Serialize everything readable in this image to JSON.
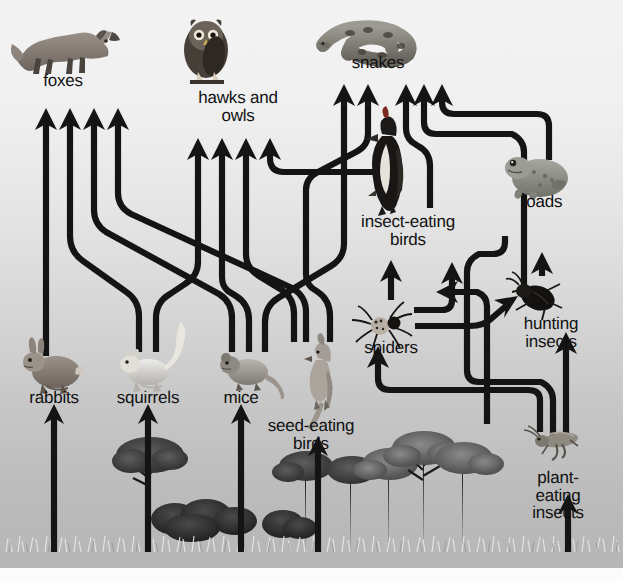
{
  "diagram": {
    "type": "food-web",
    "background": {
      "gradient_top": "#f3f3f3",
      "gradient_bottom": "#b6b6b6",
      "arrow_color": "#141414",
      "label_color": "#111111"
    },
    "nodes": [
      {
        "id": "foxes",
        "label": "foxes",
        "label_x": 63,
        "label_y": 80,
        "icon": "fox-icon",
        "trophic": "top-predator"
      },
      {
        "id": "hawks-and-owls",
        "label": "hawks and\nowls",
        "label_x": 238,
        "label_y": 97,
        "icon": "owl-icon",
        "trophic": "top-predator"
      },
      {
        "id": "snakes",
        "label": "snakes",
        "label_x": 378,
        "label_y": 61,
        "icon": "snake-icon",
        "trophic": "predator"
      },
      {
        "id": "toads",
        "label": "toads",
        "label_x": 542,
        "label_y": 200,
        "icon": "toad-icon",
        "trophic": "predator"
      },
      {
        "id": "insect-eating-birds",
        "label": "insect-eating\nbirds",
        "label_x": 408,
        "label_y": 220,
        "icon": "woodpecker-icon",
        "trophic": "predator"
      },
      {
        "id": "hunting-insects",
        "label": "hunting\ninsects",
        "label_x": 551,
        "label_y": 322,
        "icon": "beetle-icon",
        "trophic": "predator"
      },
      {
        "id": "spiders",
        "label": "spiders",
        "label_x": 391,
        "label_y": 346,
        "icon": "spider-icon",
        "trophic": "predator"
      },
      {
        "id": "rabbits",
        "label": "rabbits",
        "label_x": 54,
        "label_y": 396,
        "icon": "rabbit-icon",
        "trophic": "herbivore"
      },
      {
        "id": "squirrels",
        "label": "squirrels",
        "label_x": 148,
        "label_y": 396,
        "icon": "squirrel-icon",
        "trophic": "herbivore"
      },
      {
        "id": "mice",
        "label": "mice",
        "label_x": 241,
        "label_y": 396,
        "icon": "mouse-icon",
        "trophic": "herbivore"
      },
      {
        "id": "seed-eating-birds",
        "label": "seed-eating\nbirds",
        "label_x": 311,
        "label_y": 424,
        "icon": "cardinal-icon",
        "trophic": "herbivore"
      },
      {
        "id": "plant-eating-insects",
        "label": "plant-eating\ninsects",
        "label_x": 558,
        "label_y": 476,
        "icon": "grasshopper-icon",
        "trophic": "herbivore"
      },
      {
        "id": "plants",
        "label": "",
        "label_x": 0,
        "label_y": 0,
        "icon": "vegetation-icon",
        "trophic": "producer"
      }
    ],
    "links": [
      {
        "from": "plants",
        "to": "rabbits"
      },
      {
        "from": "plants",
        "to": "squirrels"
      },
      {
        "from": "plants",
        "to": "mice"
      },
      {
        "from": "plants",
        "to": "seed-eating-birds"
      },
      {
        "from": "plants",
        "to": "plant-eating-insects"
      },
      {
        "from": "rabbits",
        "to": "foxes"
      },
      {
        "from": "squirrels",
        "to": "foxes"
      },
      {
        "from": "squirrels",
        "to": "hawks-and-owls"
      },
      {
        "from": "mice",
        "to": "foxes"
      },
      {
        "from": "mice",
        "to": "hawks-and-owls"
      },
      {
        "from": "mice",
        "to": "snakes"
      },
      {
        "from": "seed-eating-birds",
        "to": "foxes"
      },
      {
        "from": "seed-eating-birds",
        "to": "hawks-and-owls"
      },
      {
        "from": "seed-eating-birds",
        "to": "snakes"
      },
      {
        "from": "insect-eating-birds",
        "to": "hawks-and-owls"
      },
      {
        "from": "insect-eating-birds",
        "to": "snakes"
      },
      {
        "from": "toads",
        "to": "snakes"
      },
      {
        "from": "hunting-insects",
        "to": "snakes"
      },
      {
        "from": "hunting-insects",
        "to": "toads"
      },
      {
        "from": "spiders",
        "to": "insect-eating-birds"
      },
      {
        "from": "spiders",
        "to": "hunting-insects"
      },
      {
        "from": "plant-eating-insects",
        "to": "spiders"
      },
      {
        "from": "plant-eating-insects",
        "to": "hunting-insects"
      },
      {
        "from": "plant-eating-insects",
        "to": "insect-eating-birds"
      },
      {
        "from": "plant-eating-insects",
        "to": "toads"
      }
    ]
  }
}
